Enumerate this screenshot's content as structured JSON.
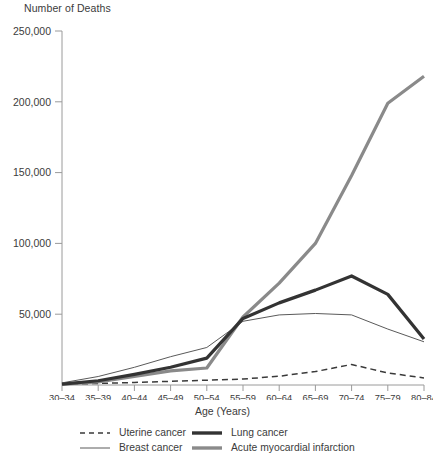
{
  "chart_data": {
    "type": "line",
    "title": "",
    "ylabel": "Number of Deaths",
    "xlabel": "Age (Years)",
    "categories": [
      "30–34",
      "35–39",
      "40–44",
      "45–49",
      "50–54",
      "55–59",
      "60–64",
      "65–69",
      "70–74",
      "75–79",
      "80–84"
    ],
    "ytick_labels": [
      "250,000",
      "200,000",
      "150,000",
      "100,000",
      "50,000"
    ],
    "yticks": [
      250000,
      200000,
      150000,
      100000,
      50000
    ],
    "ylim": [
      0,
      250000
    ],
    "grid": false,
    "legend_position": "bottom",
    "series": [
      {
        "name": "Uterine cancer",
        "style": "dashed-thin",
        "color": "#3a3a3a",
        "values": [
          600,
          1100,
          1800,
          2600,
          3400,
          4200,
          6200,
          9500,
          14500,
          8500,
          5000
        ]
      },
      {
        "name": "Breast cancer",
        "style": "solid-thin",
        "color": "#5a5a5a",
        "values": [
          1500,
          6000,
          12500,
          20000,
          26500,
          45000,
          49500,
          50500,
          49500,
          39500,
          30500
        ]
      },
      {
        "name": "Lung cancer",
        "style": "solid-thick",
        "color": "#333333",
        "values": [
          600,
          3000,
          7500,
          12500,
          19000,
          47000,
          58000,
          67000,
          77000,
          64000,
          32500
        ]
      },
      {
        "name": "Acute myocardial infarction",
        "style": "solid-thick",
        "color": "#8a8a8a",
        "values": [
          600,
          2200,
          6000,
          10000,
          12000,
          48000,
          72000,
          100000,
          148000,
          199000,
          218000
        ]
      }
    ]
  },
  "legend": {
    "items": [
      {
        "label": "Uterine cancer"
      },
      {
        "label": "Breast cancer"
      },
      {
        "label": "Lung cancer"
      },
      {
        "label": "Acute myocardial infarction"
      }
    ]
  }
}
